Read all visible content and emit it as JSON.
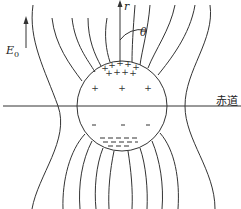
{
  "diagram": {
    "type": "field-lines-around-sphere",
    "labels": {
      "field": "E",
      "field_sub": "0",
      "radial_axis": "r",
      "angle": "θ",
      "equator": "赤道"
    },
    "sphere": {
      "center": [
        122,
        141
      ],
      "radius": 45,
      "top_charge": "+",
      "bottom_charge": "−"
    },
    "colors": {
      "line": "#333333",
      "background": "#ffffff"
    }
  }
}
